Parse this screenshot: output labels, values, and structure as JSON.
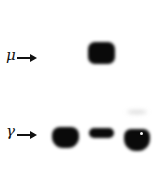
{
  "figure": {
    "type": "western-blot",
    "labels": {
      "mu": "μ",
      "gamma": "γ"
    },
    "lanes": 3,
    "bands": [
      {
        "id": "mu-lane2",
        "chain": "μ",
        "lane": 2,
        "intensity": "strong"
      },
      {
        "id": "gamma-lane1",
        "chain": "γ",
        "lane": 1,
        "intensity": "strong"
      },
      {
        "id": "gamma-lane2",
        "chain": "γ",
        "lane": 2,
        "intensity": "moderate"
      },
      {
        "id": "gamma-lane3",
        "chain": "γ",
        "lane": 3,
        "intensity": "strong"
      }
    ],
    "colors": {
      "background": "#ffffff",
      "band": "#0a0a0a"
    }
  }
}
